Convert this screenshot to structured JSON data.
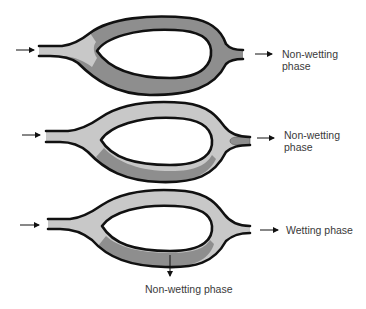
{
  "figure": {
    "colors": {
      "background": "#ffffff",
      "wetting_fill": "#c8c8c8",
      "nonwetting_fill": "#8e8e8e",
      "outline": "#111111",
      "text": "#3a3a3a"
    },
    "panels": [
      {
        "id": "panel-1",
        "inlet_arrow": "right-arrow",
        "outlet_arrow": "right-arrow",
        "outlet_label_line1": "Non-wetting",
        "outlet_label_line2": "phase"
      },
      {
        "id": "panel-2",
        "inlet_arrow": "right-arrow",
        "outlet_arrow": "right-arrow",
        "outlet_label_line1": "Non-wetting",
        "outlet_label_line2": "phase"
      },
      {
        "id": "panel-3",
        "inlet_arrow": "right-arrow",
        "outlet_arrow": "right-arrow",
        "outlet_label": "Wetting phase",
        "bottom_arrow": "down-arrow",
        "bottom_label": "Non-wetting phase"
      }
    ]
  }
}
